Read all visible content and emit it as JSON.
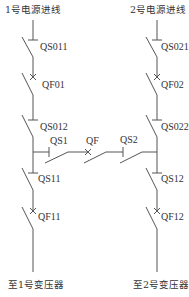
{
  "sources": {
    "left_title": "1号电源进线",
    "right_title": "2号电源进线"
  },
  "loads": {
    "left": "至1号变压器",
    "right": "至2号变压器"
  },
  "left_branch": {
    "isolator_top": "QS011",
    "breaker": "QF01",
    "isolator_mid": "QS012",
    "isolator_out": "QS11",
    "breaker_out": "QF11"
  },
  "right_branch": {
    "isolator_top": "QS021",
    "breaker": "QF02",
    "isolator_mid": "QS022",
    "isolator_out": "QS12",
    "breaker_out": "QF12"
  },
  "tie": {
    "isolator_left": "QS1",
    "breaker": "QF",
    "isolator_right": "QS2"
  },
  "colors": {
    "line": "#555555",
    "text": "#333333",
    "background": "#ffffff"
  }
}
